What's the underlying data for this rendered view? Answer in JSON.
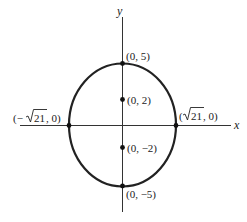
{
  "diagram": {
    "axes": {
      "x_label": "x",
      "y_label": "y"
    },
    "ellipse": {
      "center": [
        0,
        0
      ],
      "semi_major_vertical": 5,
      "semi_minor_horizontal": "√21",
      "stroke_color": "#222222"
    },
    "points": {
      "top_vertex": {
        "label": "(0, 5)"
      },
      "focus_upper": {
        "label": "(0, 2)"
      },
      "focus_lower": {
        "label": "(0, −2)"
      },
      "bottom_vertex": {
        "label": "(0, −5)"
      },
      "left_intercept": {
        "label_prefix": "(−",
        "label_radicand": "21",
        "label_suffix": ", 0)"
      },
      "right_intercept": {
        "label_prefix": "(",
        "label_radicand": "21",
        "label_suffix": ", 0)"
      }
    }
  }
}
